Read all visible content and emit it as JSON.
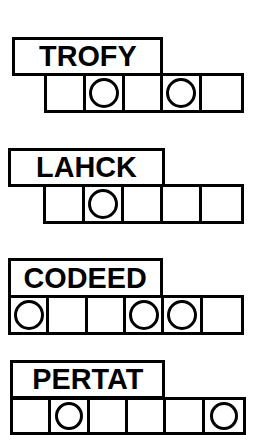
{
  "sheet": {
    "title": "jumble-word-puzzle",
    "ink_color": "#000000",
    "paper_color": "#ffffff"
  },
  "puzzles": [
    {
      "id": "puzzle-1",
      "scrambled_word": "TROFY",
      "letter_count": 5,
      "answer_cells": [
        "",
        "",
        "",
        "",
        ""
      ],
      "circled_positions": [
        2,
        4
      ],
      "box": {
        "left": 12,
        "top": 37,
        "width": 151,
        "height": 39
      },
      "strip": {
        "left": 44,
        "top": 73,
        "width": 200,
        "height": 40,
        "cells": 5
      }
    },
    {
      "id": "puzzle-2",
      "scrambled_word": "LAHCK",
      "letter_count": 5,
      "answer_cells": [
        "",
        "",
        "",
        "",
        ""
      ],
      "circled_positions": [
        2
      ],
      "box": {
        "left": 8,
        "top": 148,
        "width": 157,
        "height": 39
      },
      "strip": {
        "left": 43,
        "top": 184,
        "width": 201,
        "height": 40,
        "cells": 5
      }
    },
    {
      "id": "puzzle-3",
      "scrambled_word": "CODEED",
      "letter_count": 6,
      "answer_cells": [
        "",
        "",
        "",
        "",
        "",
        ""
      ],
      "circled_positions": [
        1,
        4,
        5
      ],
      "box": {
        "left": 8,
        "top": 258,
        "width": 155,
        "height": 40
      },
      "strip": {
        "left": 8,
        "top": 295,
        "width": 236,
        "height": 40,
        "cells": 6
      }
    },
    {
      "id": "puzzle-4",
      "scrambled_word": "PERTAT",
      "letter_count": 6,
      "answer_cells": [
        "",
        "",
        "",
        "",
        "",
        ""
      ],
      "circled_positions": [
        2,
        6
      ],
      "box": {
        "left": 10,
        "top": 360,
        "width": 155,
        "height": 39
      },
      "strip": {
        "left": 10,
        "top": 397,
        "width": 236,
        "height": 38,
        "cells": 6
      }
    }
  ]
}
